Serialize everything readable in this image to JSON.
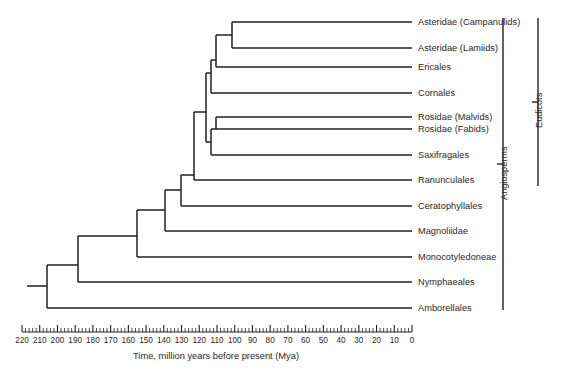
{
  "figure": {
    "background_color": "#ffffff",
    "line_color": "#231f20",
    "text_color": "#2a2628"
  },
  "axis": {
    "caption": "Time, million years before present (Mya)",
    "unit": "Mya",
    "direction": "reversed",
    "min": 0,
    "max": 220,
    "major_tick_interval": 10,
    "minor_tick_interval": 2,
    "tick_labels": [
      "220",
      "210",
      "200",
      "190",
      "180",
      "170",
      "160",
      "150",
      "140",
      "130",
      "120",
      "110",
      "100",
      "90",
      "80",
      "70",
      "60",
      "50",
      "40",
      "30",
      "20",
      "10",
      "0"
    ],
    "tick_values": [
      220,
      210,
      200,
      190,
      180,
      170,
      160,
      150,
      140,
      130,
      120,
      110,
      100,
      90,
      80,
      70,
      60,
      50,
      40,
      30,
      20,
      10,
      0
    ]
  },
  "leaves": [
    {
      "label": "Asteridae (Campanulids)"
    },
    {
      "label": "Asteridae (Lamiids)"
    },
    {
      "label": "Ericales"
    },
    {
      "label": "Cornales"
    },
    {
      "label": "Rosidae (Malvids)"
    },
    {
      "label": "Rosidae (Fabids)"
    },
    {
      "label": "Saxifragales"
    },
    {
      "label": "Ranunculales"
    },
    {
      "label": "Ceratophyllales"
    },
    {
      "label": "Magnoliidae"
    },
    {
      "label": "Monocotyledoneae"
    },
    {
      "label": "Amborellales"
    }
  ],
  "leaf_order_note": "Nymphaeales appears between Monocotyledoneae and Amborellales",
  "taxa": [
    "Asteridae (Campanulids)",
    "Asteridae (Lamiids)",
    "Ericales",
    "Cornales",
    "Rosidae (Malvids)",
    "Rosidae (Fabids)",
    "Saxifragales",
    "Ranunculales",
    "Ceratophyllales",
    "Magnoliidae",
    "Monocotyledoneae",
    "Nymphaeales",
    "Amborellales"
  ],
  "clade_brackets": [
    {
      "label": "Angiosperms",
      "from_taxon": "Asteridae (Campanulids)",
      "to_taxon": "Amborellales"
    },
    {
      "label": "Eudicots",
      "from_taxon": "Asteridae (Campanulids)",
      "to_taxon": "Ranunculales"
    }
  ],
  "chart_data": {
    "type": "tree",
    "title": "",
    "xlabel": "Time, million years before present (Mya)",
    "ylabel": "",
    "xlim": [
      220,
      0
    ],
    "grid": false,
    "legend": "none",
    "tip_labels": [
      "Asteridae (Campanulids)",
      "Asteridae (Lamiids)",
      "Ericales",
      "Cornales",
      "Rosidae (Malvids)",
      "Rosidae (Fabids)",
      "Saxifragales",
      "Ranunculales",
      "Ceratophyllales",
      "Magnoliidae",
      "Monocotyledoneae",
      "Nymphaeales",
      "Amborellales"
    ],
    "tip_age_mya": 0,
    "nodes": [
      {
        "name": "root-angiosperms",
        "age_mya": 206,
        "children": [
          "Amborellales",
          "node-post-amborella"
        ]
      },
      {
        "name": "node-post-amborella",
        "age_mya": 188,
        "children": [
          "Nymphaeales",
          "node-mesangiosperms"
        ]
      },
      {
        "name": "node-mesangiosperms",
        "age_mya": 155,
        "children": [
          "Monocotyledoneae",
          "node-magnoliid-eudicot"
        ]
      },
      {
        "name": "node-magnoliid-eudicot",
        "age_mya": 139,
        "children": [
          "Magnoliidae",
          "node-ceratophyllales-eudicots"
        ]
      },
      {
        "name": "node-ceratophyllales-eudicots",
        "age_mya": 130,
        "children": [
          "Ceratophyllales",
          "node-eudicots"
        ]
      },
      {
        "name": "node-eudicots",
        "age_mya": 123,
        "children": [
          "Ranunculales",
          "node-core-eudicots"
        ]
      },
      {
        "name": "node-core-eudicots",
        "age_mya": 116,
        "children": [
          "node-superrosids",
          "node-superasterids"
        ]
      },
      {
        "name": "node-superrosids",
        "age_mya": 113,
        "children": [
          "Saxifragales",
          "node-rosids"
        ]
      },
      {
        "name": "node-rosids",
        "age_mya": 110,
        "children": [
          "Rosidae (Fabids)",
          "Rosidae (Malvids)"
        ]
      },
      {
        "name": "node-superasterids",
        "age_mya": 113,
        "children": [
          "Cornales",
          "node-asterids-upper"
        ]
      },
      {
        "name": "node-asterids-upper",
        "age_mya": 110,
        "children": [
          "Ericales",
          "node-asteridae"
        ]
      },
      {
        "name": "node-asteridae",
        "age_mya": 101,
        "children": [
          "Asteridae (Lamiids)",
          "Asteridae (Campanulids)"
        ]
      }
    ]
  }
}
